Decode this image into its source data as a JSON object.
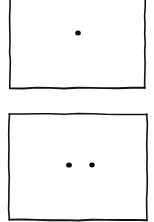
{
  "diagram": {
    "colors": {
      "background": "#ffffff",
      "stroke": "#111111",
      "dot": "#0a0a0a"
    },
    "panels": [
      {
        "id": "top-panel",
        "dot_count": 1,
        "frame": {
          "x1": 10,
          "y1": -2,
          "x2": 145,
          "y2": 88,
          "top_border_visible": false
        },
        "dots": [
          {
            "cx": 78,
            "cy": 33,
            "r": 2.8
          }
        ]
      },
      {
        "id": "bottom-panel",
        "dot_count": 2,
        "frame": {
          "x1": 9,
          "y1": 114,
          "x2": 147,
          "y2": 220,
          "top_border_visible": true
        },
        "dots": [
          {
            "cx": 69,
            "cy": 165,
            "r": 2.9
          },
          {
            "cx": 92,
            "cy": 165,
            "r": 2.7
          }
        ]
      }
    ]
  }
}
